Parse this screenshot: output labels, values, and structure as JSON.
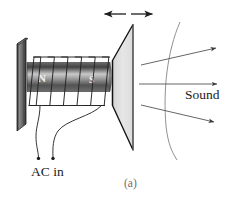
{
  "figure": {
    "caption": "(a)",
    "labels": {
      "sound": "Sound",
      "ac_in": "AC in",
      "north_pole": "N",
      "south_pole": "S"
    },
    "colors": {
      "plate_dark": "#3a3a3a",
      "plate_light": "#8d8d8d",
      "magnet_dark": "#4a4a4a",
      "magnet_light": "#c8c8c8",
      "cone_fill": "#e2e2e2",
      "cone_stroke": "#1a1a1a",
      "wire_stroke": "#2a2a2a",
      "wavefront_stroke": "#8a8a8a",
      "ray_stroke": "#6a6a6a",
      "text": "#1a1a1a",
      "caption_text": "#6e6e6e"
    },
    "parts": {
      "mounting_plate": "mounting-plate",
      "magnet_core": "magnet-core",
      "coil": "coil-winding",
      "coil_turns": 6,
      "speaker_cone": "speaker-cone",
      "vibration_arrow": "double-headed-vibration-arrow",
      "terminals": 2,
      "sound_rays": 3,
      "wavefront_arcs": 1
    }
  }
}
